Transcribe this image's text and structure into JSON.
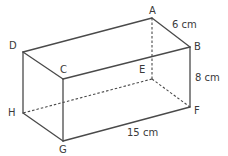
{
  "diagram": {
    "type": "cuboid",
    "vertices": {
      "A": {
        "label": "A",
        "x": 152,
        "y": 18,
        "lx": 149,
        "ly": 14
      },
      "B": {
        "label": "B",
        "x": 190,
        "y": 47,
        "lx": 194,
        "ly": 50
      },
      "C": {
        "label": "C",
        "x": 63,
        "y": 79,
        "lx": 60,
        "ly": 73
      },
      "D": {
        "label": "D",
        "x": 23,
        "y": 52,
        "lx": 9,
        "ly": 49
      },
      "E": {
        "label": "E",
        "x": 152,
        "y": 79,
        "lx": 139,
        "ly": 73
      },
      "F": {
        "label": "F",
        "x": 190,
        "y": 107,
        "lx": 194,
        "ly": 114
      },
      "G": {
        "label": "G",
        "x": 63,
        "y": 141,
        "lx": 59,
        "ly": 153
      },
      "H": {
        "label": "H",
        "x": 23,
        "y": 113,
        "lx": 8,
        "ly": 116
      }
    },
    "visible_edges": [
      "AB",
      "AD",
      "DC",
      "CB",
      "DH",
      "CG",
      "BF",
      "HG",
      "GF"
    ],
    "hidden_edges": [
      "AE",
      "EF",
      "EH"
    ],
    "dimensions": [
      {
        "text": "6 cm",
        "edge": "AB",
        "x": 172,
        "y": 28
      },
      {
        "text": "8 cm",
        "edge": "BF",
        "x": 195,
        "y": 81
      },
      {
        "text": "15 cm",
        "edge": "GF",
        "x": 127,
        "y": 136
      }
    ]
  }
}
